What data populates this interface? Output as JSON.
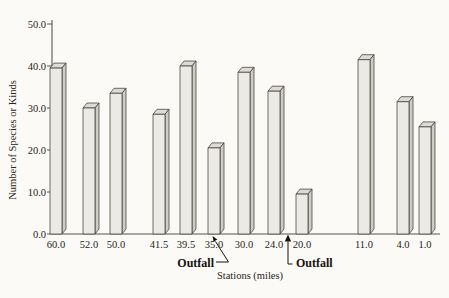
{
  "chart_data": {
    "type": "bar",
    "title": "",
    "xlabel": "Stations (miles)",
    "ylabel": "Number of Species or Kinds",
    "categories": [
      "60.0",
      "52.0",
      "50.0",
      "41.5",
      "39.5",
      "35.0",
      "30.0",
      "24.0",
      "20.0",
      "11.0",
      "4.0",
      "1.0"
    ],
    "values": [
      39.5,
      30.0,
      33.5,
      28.5,
      40.0,
      20.5,
      38.5,
      34.0,
      9.5,
      41.5,
      31.5,
      25.5
    ],
    "ylim": [
      0,
      50
    ],
    "y_tick_values": [
      0,
      10,
      20,
      30,
      40,
      50
    ],
    "y_tick_labels": [
      "0.0",
      "10.0",
      "20.0",
      "30.0",
      "40.0",
      "50.0"
    ],
    "grid": false,
    "legend": "none",
    "bar_style": "3d-column",
    "annotations": [
      {
        "label": "Outfall",
        "position": "arrow pointing to axis between stations 39.5 and 35.0"
      },
      {
        "label": "Outfall",
        "position": "arrow pointing to axis between stations 24.0 and 20.0"
      }
    ],
    "colors": {
      "background": "#fbfaf6",
      "bar_front": "#eceae5",
      "bar_side": "#ceccc5",
      "bar_top": "#dddbd4",
      "bar_outline": "#403e39",
      "axis": "#57554f",
      "text": "#262520"
    }
  }
}
